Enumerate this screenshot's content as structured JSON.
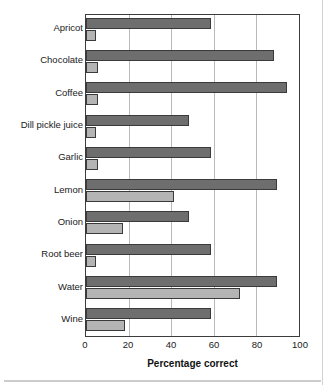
{
  "chart_data": {
    "type": "bar",
    "orientation": "horizontal",
    "title": "",
    "xlabel": "Percentage correct",
    "ylabel": "",
    "xlim": [
      0,
      100
    ],
    "xticks": [
      0,
      20,
      40,
      60,
      80,
      100
    ],
    "grid": true,
    "legend": "none",
    "categories": [
      "Apricot",
      "Chocolate",
      "Coffee",
      "Dill pickle juice",
      "Garlic",
      "Lemon",
      "Onion",
      "Root beer",
      "Water",
      "Wine"
    ],
    "series": [
      {
        "name": "dark",
        "color": "#6e6e6e",
        "values": [
          58,
          88,
          94,
          48,
          58,
          89,
          48,
          58,
          89,
          58
        ]
      },
      {
        "name": "light",
        "color": "#b4b4b4",
        "values": [
          4,
          5,
          5,
          4,
          5,
          41,
          17,
          4,
          72,
          18
        ]
      }
    ]
  },
  "axis": {
    "tick_labels": [
      "0",
      "20",
      "40",
      "60",
      "80",
      "100"
    ],
    "x_title": "Percentage correct"
  },
  "colors": {
    "bar_dark": "#6e6e6e",
    "bar_light": "#b4b4b4",
    "bar_outline": "#3a3a3a",
    "frame": "#3c3c3c",
    "gridline": "#b9b9b9",
    "text": "#1a1a1a",
    "background": "#ffffff"
  }
}
